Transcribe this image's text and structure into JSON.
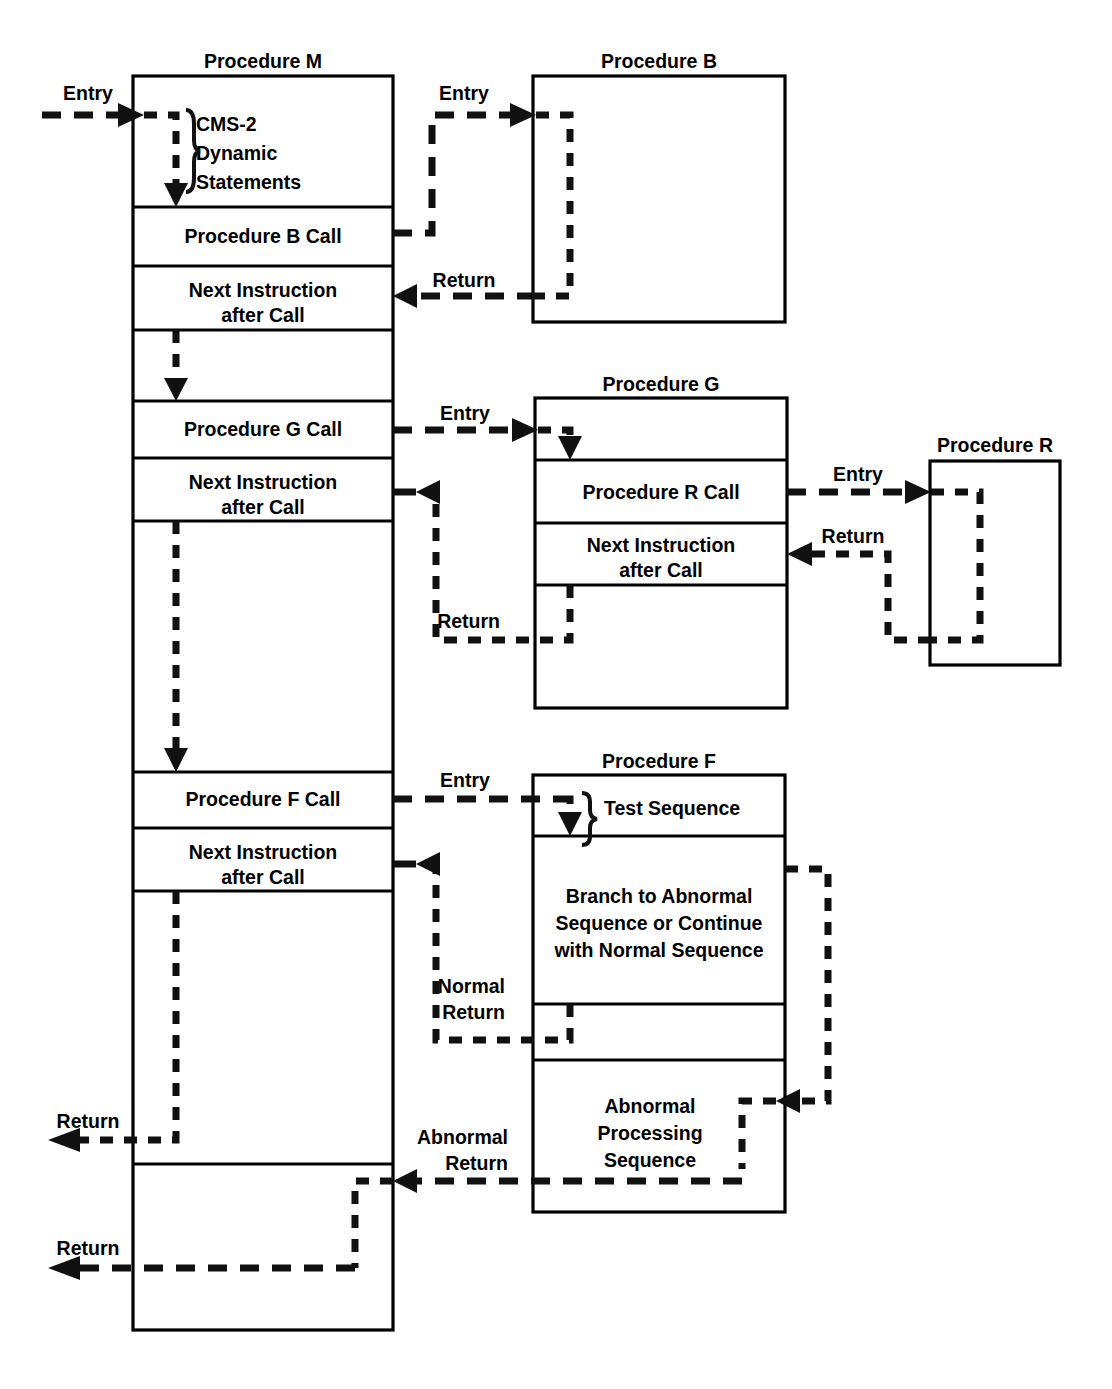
{
  "diagram": {
    "stroke_color": "#111111",
    "box_color": "#000000",
    "background": "#ffffff",
    "procedures": [
      {
        "id": "M",
        "title": "Procedure M",
        "cells": [
          {
            "label": "CMS-2\nDynamic\nStatements",
            "line1": "CMS-2",
            "line2": "Dynamic",
            "line3": "Statements"
          },
          {
            "label": "Procedure B Call"
          },
          {
            "label": "Next Instruction after Call",
            "line1": "Next Instruction",
            "line2": "after Call"
          },
          {
            "label": ""
          },
          {
            "label": "Procedure G Call"
          },
          {
            "label": "Next Instruction after Call",
            "line1": "Next Instruction",
            "line2": "after Call"
          },
          {
            "label": ""
          },
          {
            "label": "Procedure F Call"
          },
          {
            "label": "Next Instruction after Call",
            "line1": "Next Instruction",
            "line2": "after Call"
          },
          {
            "label": ""
          },
          {
            "label": ""
          }
        ]
      },
      {
        "id": "B",
        "title": "Procedure B",
        "cells": []
      },
      {
        "id": "G",
        "title": "Procedure G",
        "cells": [
          {
            "label": ""
          },
          {
            "label": "Procedure R Call"
          },
          {
            "label": "Next Instruction after Call",
            "line1": "Next Instruction",
            "line2": "after Call"
          },
          {
            "label": ""
          }
        ]
      },
      {
        "id": "R",
        "title": "Procedure R",
        "cells": []
      },
      {
        "id": "F",
        "title": "Procedure F",
        "cells": [
          {
            "label": "Test Sequence"
          },
          {
            "label": "Branch to Abnormal Sequence or Continue with Normal Sequence",
            "line1": "Branch to Abnormal",
            "line2": "Sequence or Continue",
            "line3": "with Normal Sequence"
          },
          {
            "label": ""
          },
          {
            "label": "Abnormal Processing Sequence",
            "line1": "Abnormal",
            "line2": "Processing",
            "line3": "Sequence"
          }
        ]
      }
    ],
    "flow_labels": {
      "entry_m": "Entry",
      "entry_b": "Entry",
      "return_b": "Return",
      "entry_g": "Entry",
      "return_g": "Return",
      "entry_r": "Entry",
      "return_r": "Return",
      "entry_f": "Entry",
      "normal_return_line1": "Normal",
      "normal_return_line2": "Return",
      "abnormal_return_line1": "Abnormal",
      "abnormal_return_line2": "Return",
      "return_m_upper": "Return",
      "return_m_lower": "Return"
    }
  }
}
